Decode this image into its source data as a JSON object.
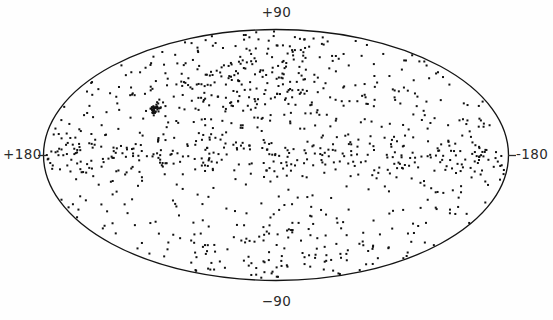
{
  "figure": {
    "type": "all-sky-scatter",
    "projection": "hammer-aitoff-equal-area-ellipse",
    "background_color": "#fefefe",
    "outline_color": "#141414",
    "point_color": "#111111",
    "label_color": "#2b2b2b"
  },
  "labels": {
    "top": "+90",
    "bottom": "−90",
    "left": "+180",
    "right": "-180"
  },
  "chart_data": {
    "type": "scatter",
    "title": "",
    "xlabel": "",
    "ylabel": "",
    "projection": "hammer",
    "grid": false,
    "legend": null,
    "xlim": [
      180,
      -180
    ],
    "ylim": [
      -90,
      90
    ],
    "xtick_labels": [
      "+180",
      "-180"
    ],
    "ytick_labels": [
      "+90",
      "−90"
    ],
    "marker": "square",
    "marker_size_px": 2,
    "n_points": 1080,
    "structure_notes": [
      "dense narrow band of points along galactic equator (b = 0)",
      "broad overdensity in upper-central hemisphere",
      "compact tight cluster near l=+95, b=+28",
      "elevated point density along lower rim of ellipse"
    ],
    "components": [
      {
        "name": "isotropic-background",
        "n": 470,
        "distribution": "uniform-on-sphere"
      },
      {
        "name": "galactic-plane-band",
        "n": 250,
        "lat_sigma_deg": 6.0
      },
      {
        "name": "north-overdensity",
        "n": 260,
        "center_lon_deg": 30,
        "center_lat_deg": 45,
        "spread_deg": 46
      },
      {
        "name": "compact-cluster",
        "n": 34,
        "center_lon_deg": 96,
        "center_lat_deg": 28,
        "spread_deg": 2.2
      },
      {
        "name": "south-rim-enhancement",
        "n": 66,
        "center_lat_deg": -58,
        "spread_deg": 16
      }
    ],
    "axis_geometry": {
      "center_x": 276,
      "center_y": 155,
      "semi_axis_x": 233,
      "semi_axis_y": 126
    }
  }
}
